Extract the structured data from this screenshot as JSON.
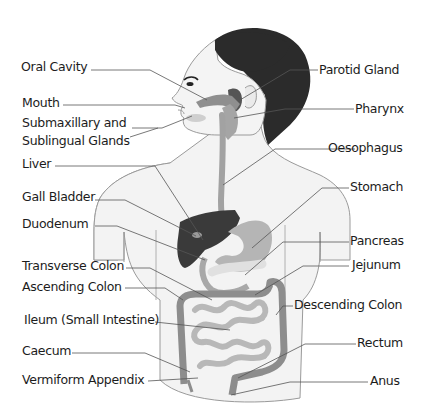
{
  "diagram": {
    "colors": {
      "hair": "#2b2b2b",
      "skin": "#f2f2f2",
      "outline": "#9a9a9a",
      "organ_light": "#b9b9b9",
      "organ_mid": "#8f8f8f",
      "liver": "#3a3a3a",
      "leader_line": "#555555",
      "text": "#1c1c1c"
    },
    "left_labels": [
      {
        "id": "oral-cavity",
        "text": "Oral  Cavity"
      },
      {
        "id": "mouth",
        "text": "Mouth"
      },
      {
        "id": "submaxillary-1",
        "text": "Submaxillary and"
      },
      {
        "id": "submaxillary-2",
        "text": "Sublingual Glands"
      },
      {
        "id": "liver",
        "text": "Liver"
      },
      {
        "id": "gall-bladder",
        "text": "Gall Bladder"
      },
      {
        "id": "duodenum",
        "text": "Duodenum"
      },
      {
        "id": "transverse-colon",
        "text": "Transverse Colon"
      },
      {
        "id": "ascending-colon",
        "text": "Ascending Colon"
      },
      {
        "id": "ileum",
        "text": "Ileum (Small Intestine)"
      },
      {
        "id": "caecum",
        "text": "Caecum"
      },
      {
        "id": "vermiform-appendix",
        "text": "Vermiform Appendix"
      }
    ],
    "right_labels": [
      {
        "id": "parotid-gland",
        "text": "Parotid Gland"
      },
      {
        "id": "pharynx",
        "text": "Pharynx"
      },
      {
        "id": "oesophagus",
        "text": "Oesophagus"
      },
      {
        "id": "stomach",
        "text": "Stomach"
      },
      {
        "id": "pancreas",
        "text": "Pancreas"
      },
      {
        "id": "jejunum",
        "text": "Jejunum"
      },
      {
        "id": "descending-colon",
        "text": "Descending Colon"
      },
      {
        "id": "rectum",
        "text": "Rectum"
      },
      {
        "id": "anus",
        "text": "Anus"
      }
    ]
  }
}
